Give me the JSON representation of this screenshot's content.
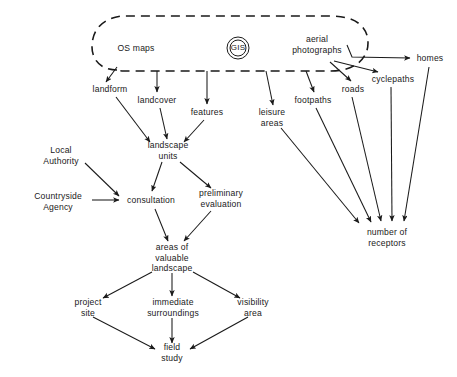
{
  "diagram": {
    "type": "flowchart",
    "background_color": "#ffffff",
    "stroke_color": "#1a1a1a",
    "text_color": "#1a1a1a",
    "container": {
      "name": "gis-data-sources-boundary",
      "style": "dashed-rounded-capsule",
      "members": [
        "OS maps",
        "GIS",
        "aerial photographs"
      ]
    },
    "nodes": [
      {
        "id": "os_maps",
        "label": "OS maps",
        "x": 136,
        "y": 48
      },
      {
        "id": "gis",
        "label": "GIS",
        "x": 238,
        "y": 48
      },
      {
        "id": "aerial",
        "label": "aerial\nphotographs",
        "x": 317,
        "y": 44
      },
      {
        "id": "homes",
        "label": "homes",
        "x": 430,
        "y": 58
      },
      {
        "id": "cyclepaths",
        "label": "cyclepaths",
        "x": 393,
        "y": 79
      },
      {
        "id": "roads",
        "label": "roads",
        "x": 353,
        "y": 89
      },
      {
        "id": "footpaths",
        "label": "footpaths",
        "x": 313,
        "y": 100
      },
      {
        "id": "leisure_areas",
        "label": "leisure\nareas",
        "x": 272,
        "y": 117
      },
      {
        "id": "landform",
        "label": "landform",
        "x": 110,
        "y": 89
      },
      {
        "id": "landcover",
        "label": "landcover",
        "x": 157,
        "y": 100
      },
      {
        "id": "features",
        "label": "features",
        "x": 207,
        "y": 112
      },
      {
        "id": "landscape_units",
        "label": "landscape\nunits",
        "x": 168,
        "y": 150
      },
      {
        "id": "local_authority",
        "label": "Local\nAuthority",
        "x": 61,
        "y": 155
      },
      {
        "id": "countryside",
        "label": "Countryside\nAgency",
        "x": 58,
        "y": 201
      },
      {
        "id": "consultation",
        "label": "consultation",
        "x": 151,
        "y": 200
      },
      {
        "id": "preliminary",
        "label": "preliminary\nevaluation",
        "x": 221,
        "y": 198
      },
      {
        "id": "areas_valuable",
        "label": "areas of\nvaluable\nlandscape",
        "x": 172,
        "y": 258
      },
      {
        "id": "project_site",
        "label": "project\nsite",
        "x": 88,
        "y": 307
      },
      {
        "id": "immediate",
        "label": "immediate\nsurroundings",
        "x": 173,
        "y": 307
      },
      {
        "id": "visibility",
        "label": "visibility\narea",
        "x": 253,
        "y": 307
      },
      {
        "id": "field_study",
        "label": "field\nstudy",
        "x": 172,
        "y": 352
      },
      {
        "id": "receptors",
        "label": "number of\nreceptors",
        "x": 387,
        "y": 237
      }
    ],
    "edges": [
      {
        "from": "os_maps",
        "to": "landform",
        "arrow": true
      },
      {
        "from": "boundary",
        "to": "landcover",
        "arrow": true
      },
      {
        "from": "boundary",
        "to": "features",
        "arrow": true
      },
      {
        "from": "boundary",
        "to": "leisure_areas",
        "arrow": true
      },
      {
        "from": "boundary",
        "to": "footpaths",
        "arrow": true
      },
      {
        "from": "aerial",
        "to": "roads",
        "arrow": true
      },
      {
        "from": "aerial",
        "to": "cyclepaths",
        "arrow": true
      },
      {
        "from": "aerial",
        "to": "homes",
        "arrow": true
      },
      {
        "from": "landform",
        "to": "landscape_units",
        "arrow": true
      },
      {
        "from": "landcover",
        "to": "landscape_units",
        "arrow": true
      },
      {
        "from": "features",
        "to": "landscape_units",
        "arrow": true
      },
      {
        "from": "landscape_units",
        "to": "consultation",
        "arrow": true
      },
      {
        "from": "landscape_units",
        "to": "preliminary",
        "arrow": true
      },
      {
        "from": "local_authority",
        "to": "consultation",
        "arrow": true
      },
      {
        "from": "countryside",
        "to": "consultation",
        "arrow": true
      },
      {
        "from": "consultation",
        "to": "areas_valuable",
        "arrow": true
      },
      {
        "from": "preliminary",
        "to": "areas_valuable",
        "arrow": true
      },
      {
        "from": "areas_valuable",
        "to": "project_site",
        "arrow": true
      },
      {
        "from": "areas_valuable",
        "to": "immediate",
        "arrow": true
      },
      {
        "from": "areas_valuable",
        "to": "visibility",
        "arrow": true
      },
      {
        "from": "project_site",
        "to": "field_study",
        "arrow": true
      },
      {
        "from": "immediate",
        "to": "field_study",
        "arrow": true
      },
      {
        "from": "visibility",
        "to": "field_study",
        "arrow": true
      },
      {
        "from": "leisure_areas",
        "to": "receptors",
        "arrow": true
      },
      {
        "from": "footpaths",
        "to": "receptors",
        "arrow": true
      },
      {
        "from": "roads",
        "to": "receptors",
        "arrow": true
      },
      {
        "from": "cyclepaths",
        "to": "receptors",
        "arrow": true
      },
      {
        "from": "homes",
        "to": "receptors",
        "arrow": true
      }
    ]
  }
}
